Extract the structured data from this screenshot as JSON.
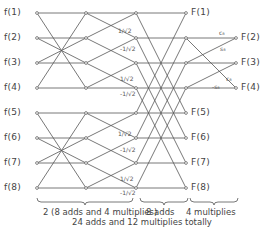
{
  "diagram": {
    "type": "signal-flow-graph",
    "inputs": [
      "f(1)",
      "f(2)",
      "f(3)",
      "f(4)",
      "f(5)",
      "f(6)",
      "f(7)",
      "f(8)"
    ],
    "outputs_right": [
      "F(1)",
      "F(5)",
      "F(6)",
      "F(7)",
      "F(8)"
    ],
    "outputs_far_right": [
      "F(2)",
      "F(3)",
      "F(4)"
    ],
    "stage2_multipliers": [
      "1/√2",
      "-1/√2",
      "1/√2",
      "-1/√2",
      "1/√2",
      "-1/√2",
      "1/√2",
      "-1/√2"
    ],
    "stage4_coefficients": [
      "c₈",
      "s₈",
      "c₈",
      "-s₈"
    ],
    "stage_labels": {
      "stage12": "2 (8 adds and 4 multiplies)",
      "stage3": "8 adds",
      "stage4": "4 multiplies"
    },
    "total": "24 adds and 12 multiplies totally"
  }
}
